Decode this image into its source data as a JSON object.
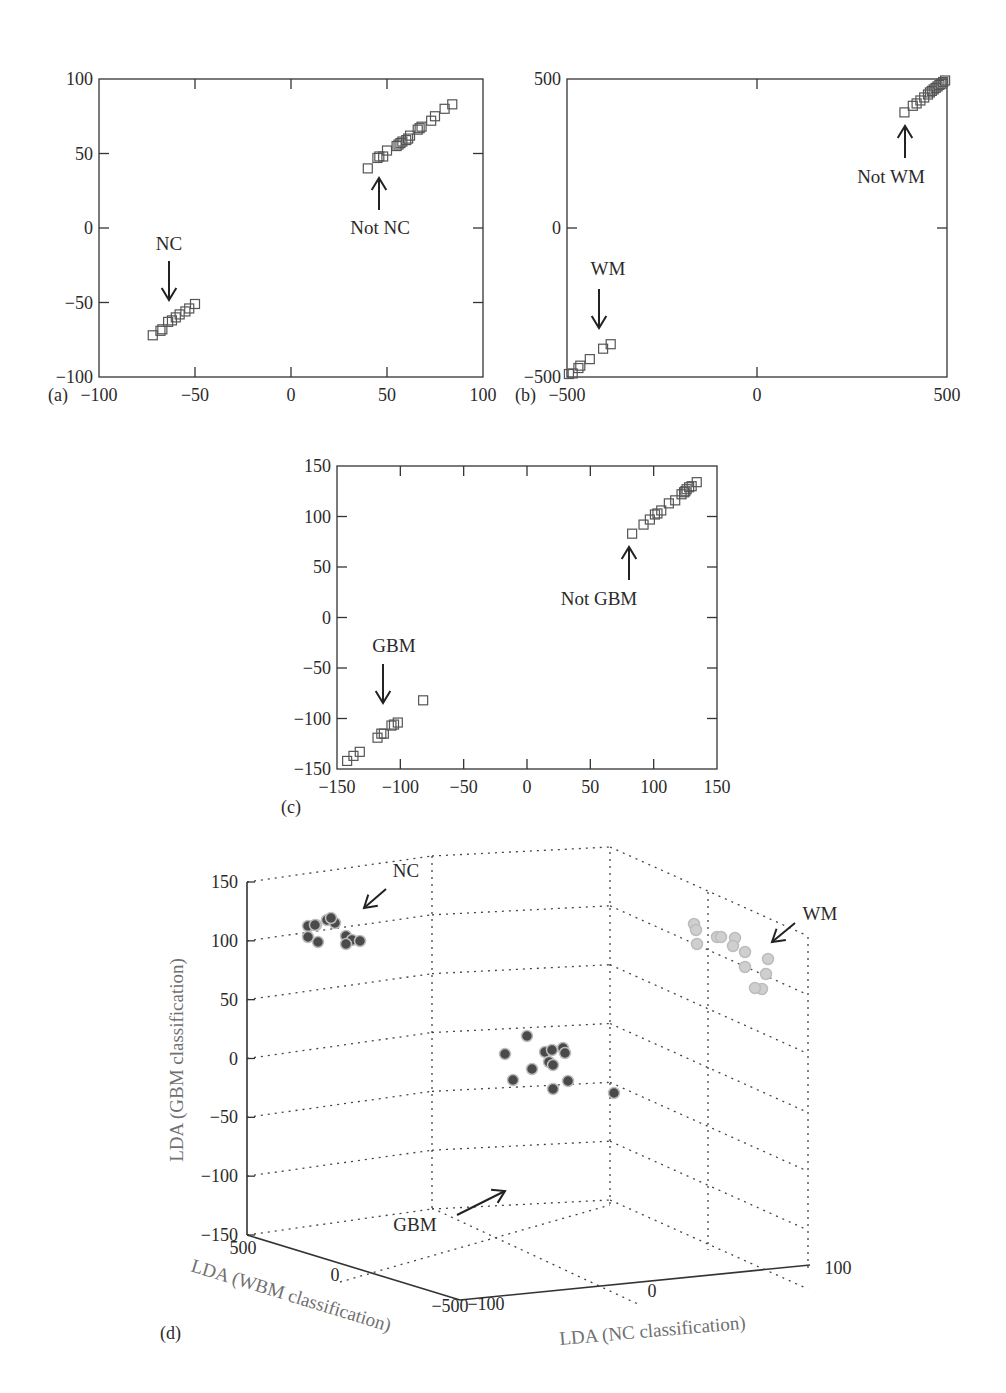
{
  "figure": {
    "panels": [
      "(a)",
      "(b)",
      "(c)",
      "(d)"
    ]
  },
  "chart_data": [
    {
      "panel": "(a)",
      "type": "scatter",
      "title": "",
      "xlabel": "",
      "ylabel": "",
      "xlim": [
        -100,
        100
      ],
      "ylim": [
        -100,
        100
      ],
      "xticks": [
        -100,
        -50,
        0,
        50,
        100
      ],
      "yticks": [
        -100,
        -50,
        0,
        50,
        100
      ],
      "grid": false,
      "marker": "open-square",
      "annotations": [
        {
          "text": "NC",
          "arrow": "down",
          "target": [
            -63,
            -52
          ]
        },
        {
          "text": "Not NC",
          "arrow": "up",
          "target": [
            45,
            35
          ]
        }
      ],
      "series": [
        {
          "name": "NC",
          "points": [
            [
              -72,
              -72
            ],
            [
              -68,
              -69
            ],
            [
              -67,
              -68
            ],
            [
              -64,
              -63
            ],
            [
              -62,
              -62
            ],
            [
              -60,
              -60
            ],
            [
              -58,
              -58
            ],
            [
              -55,
              -56
            ],
            [
              -53,
              -54
            ],
            [
              -50,
              -51
            ]
          ]
        },
        {
          "name": "Not NC",
          "points": [
            [
              40,
              40
            ],
            [
              45,
              47
            ],
            [
              46,
              48
            ],
            [
              48,
              48
            ],
            [
              50,
              52
            ],
            [
              55,
              55
            ],
            [
              56,
              56
            ],
            [
              57,
              57
            ],
            [
              58,
              58
            ],
            [
              60,
              59
            ],
            [
              61,
              60
            ],
            [
              62,
              62
            ],
            [
              66,
              66
            ],
            [
              67,
              67
            ],
            [
              68,
              68
            ],
            [
              73,
              72
            ],
            [
              75,
              75
            ],
            [
              80,
              80
            ],
            [
              84,
              83
            ]
          ]
        }
      ]
    },
    {
      "panel": "(b)",
      "type": "scatter",
      "title": "",
      "xlabel": "",
      "ylabel": "",
      "xlim": [
        -500,
        500
      ],
      "ylim": [
        -500,
        500
      ],
      "xticks": [
        -500,
        0,
        500
      ],
      "yticks": [
        -500,
        0,
        500
      ],
      "grid": false,
      "marker": "open-square",
      "annotations": [
        {
          "text": "WM",
          "arrow": "down",
          "target": [
            -415,
            -345
          ]
        },
        {
          "text": "Not WM",
          "arrow": "up",
          "target": [
            388,
            345
          ]
        }
      ],
      "series": [
        {
          "name": "WM",
          "points": [
            [
              -495,
              -490
            ],
            [
              -485,
              -488
            ],
            [
              -470,
              -470
            ],
            [
              -465,
              -462
            ],
            [
              -440,
              -440
            ],
            [
              -405,
              -405
            ],
            [
              -385,
              -390
            ]
          ]
        },
        {
          "name": "Not WM",
          "points": [
            [
              388,
              388
            ],
            [
              410,
              410
            ],
            [
              420,
              418
            ],
            [
              430,
              428
            ],
            [
              440,
              438
            ],
            [
              450,
              448
            ],
            [
              455,
              455
            ],
            [
              460,
              460
            ],
            [
              465,
              465
            ],
            [
              470,
              470
            ],
            [
              475,
              475
            ],
            [
              480,
              480
            ],
            [
              485,
              484
            ],
            [
              490,
              490
            ],
            [
              495,
              495
            ]
          ]
        }
      ]
    },
    {
      "panel": "(c)",
      "type": "scatter",
      "title": "",
      "xlabel": "",
      "ylabel": "",
      "xlim": [
        -150,
        150
      ],
      "ylim": [
        -150,
        150
      ],
      "xticks": [
        -150,
        -100,
        -50,
        0,
        50,
        100,
        150
      ],
      "yticks": [
        -150,
        -100,
        -50,
        0,
        50,
        100,
        150
      ],
      "grid": false,
      "marker": "open-square",
      "annotations": [
        {
          "text": "GBM",
          "arrow": "down",
          "target": [
            -112,
            -86
          ]
        },
        {
          "text": "Not GBM",
          "arrow": "up",
          "target": [
            82,
            70
          ]
        }
      ],
      "series": [
        {
          "name": "GBM",
          "points": [
            [
              -142,
              -142
            ],
            [
              -137,
              -137
            ],
            [
              -132,
              -133
            ],
            [
              -118,
              -119
            ],
            [
              -115,
              -115
            ],
            [
              -113,
              -115
            ],
            [
              -107,
              -107
            ],
            [
              -105,
              -106
            ],
            [
              -102,
              -104
            ],
            [
              -82,
              -82
            ]
          ]
        },
        {
          "name": "Not GBM",
          "points": [
            [
              83,
              83
            ],
            [
              92,
              92
            ],
            [
              97,
              97
            ],
            [
              101,
              102
            ],
            [
              103,
              103
            ],
            [
              106,
              106
            ],
            [
              112,
              113
            ],
            [
              117,
              116
            ],
            [
              122,
              122
            ],
            [
              124,
              124
            ],
            [
              125,
              125
            ],
            [
              126,
              127
            ],
            [
              128,
              129
            ],
            [
              130,
              130
            ],
            [
              134,
              134
            ]
          ]
        }
      ]
    },
    {
      "panel": "(d)",
      "type": "scatter3d",
      "title": "",
      "xlabel": "LDA (NC classification)",
      "ylabel": "LDA (WBM classification)",
      "zlabel": "LDA (GBM classification)",
      "xlim": [
        -100,
        100
      ],
      "ylim": [
        -500,
        500
      ],
      "zlim": [
        -150,
        150
      ],
      "xticks": [
        -100,
        0,
        100
      ],
      "yticks": [
        -500,
        0,
        500
      ],
      "zticks": [
        -150,
        -100,
        -50,
        0,
        50,
        100,
        150
      ],
      "grid": true,
      "marker": "filled-circle",
      "annotations": [
        {
          "text": "NC",
          "arrow": "down-left"
        },
        {
          "text": "WM",
          "arrow": "down-left"
        },
        {
          "text": "GBM",
          "arrow": "up-right"
        }
      ],
      "series": [
        {
          "name": "NC",
          "color": "#4a4a4a",
          "count": 12,
          "approx_z_range": [
            95,
            130
          ]
        },
        {
          "name": "WM",
          "color": "#cfcfcf",
          "count": 13,
          "approx_z_range": [
            60,
            115
          ]
        },
        {
          "name": "GBM",
          "color": "#4a4a4a",
          "count": 13,
          "approx_z_range": [
            -125,
            -65
          ]
        }
      ]
    }
  ]
}
